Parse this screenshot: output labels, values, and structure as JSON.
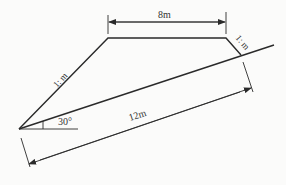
{
  "diagram": {
    "type": "embankment-cross-section",
    "labels": {
      "top_width": "8m",
      "left_slope": "1: m",
      "right_slope": "1: m",
      "slope_length": "12m",
      "angle": "30°"
    },
    "colors": {
      "line": "#2a2a2a",
      "background": "#fbfbfa"
    }
  }
}
